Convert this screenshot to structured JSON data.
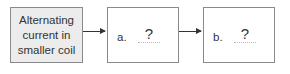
{
  "diagram": {
    "boxes": [
      {
        "id": "start",
        "text": "Alternating\ncurrent in\nsmaller coil",
        "fill": "#ececec"
      },
      {
        "id": "a",
        "label": "a.",
        "value": "?"
      },
      {
        "id": "b",
        "label": "b.",
        "value": "?"
      }
    ],
    "arrows": [
      {
        "from": "start",
        "to": "a"
      },
      {
        "from": "a",
        "to": "b"
      }
    ]
  }
}
